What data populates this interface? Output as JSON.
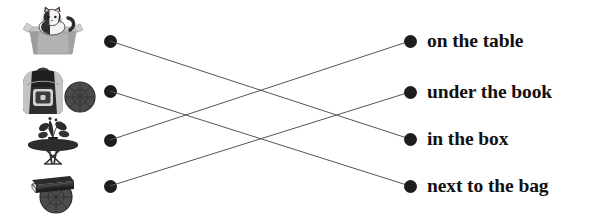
{
  "worksheet": {
    "title": "Matching exercise: pictures to prepositional phrases",
    "width": 603,
    "height": 218,
    "background_color": "#ffffff",
    "dot_color": "#1d1d1d",
    "line_color": "#555555",
    "text_color": "#111111"
  },
  "pictures": [
    {
      "id": "cat-in-box",
      "alt": "grey cardboard box with a black and white cat sitting inside",
      "dot_x": 110,
      "dot_y": 41
    },
    {
      "id": "backpack-and-ball",
      "alt": "black and grey school backpack standing next to a dark round ball",
      "dot_x": 110,
      "dot_y": 91
    },
    {
      "id": "table-with-plant",
      "alt": "small round black table with a potted plant on top",
      "dot_x": 110,
      "dot_y": 140
    },
    {
      "id": "book-on-ball",
      "alt": "dark closed book resting on top of a round ball",
      "dot_x": 110,
      "dot_y": 186
    }
  ],
  "phrases": [
    {
      "id": "on-the-table",
      "label": "on the table",
      "dot_x": 410,
      "dot_y": 41
    },
    {
      "id": "under-the-book",
      "label": "under the book",
      "dot_x": 410,
      "dot_y": 92
    },
    {
      "id": "in-the-box",
      "label": "in the box",
      "dot_x": 410,
      "dot_y": 139
    },
    {
      "id": "next-to-the-bag",
      "label": "next to the bag",
      "dot_x": 410,
      "dot_y": 186
    }
  ],
  "connections": [
    {
      "from": "cat-in-box",
      "to": "in-the-box",
      "x1": 110,
      "y1": 41,
      "x2": 410,
      "y2": 139
    },
    {
      "from": "backpack-and-ball",
      "to": "next-to-the-bag",
      "x1": 110,
      "y1": 91,
      "x2": 410,
      "y2": 186
    },
    {
      "from": "table-with-plant",
      "to": "on-the-table",
      "x1": 110,
      "y1": 140,
      "x2": 410,
      "y2": 41
    },
    {
      "from": "book-on-ball",
      "to": "under-the-book",
      "x1": 110,
      "y1": 186,
      "x2": 410,
      "y2": 92
    }
  ]
}
